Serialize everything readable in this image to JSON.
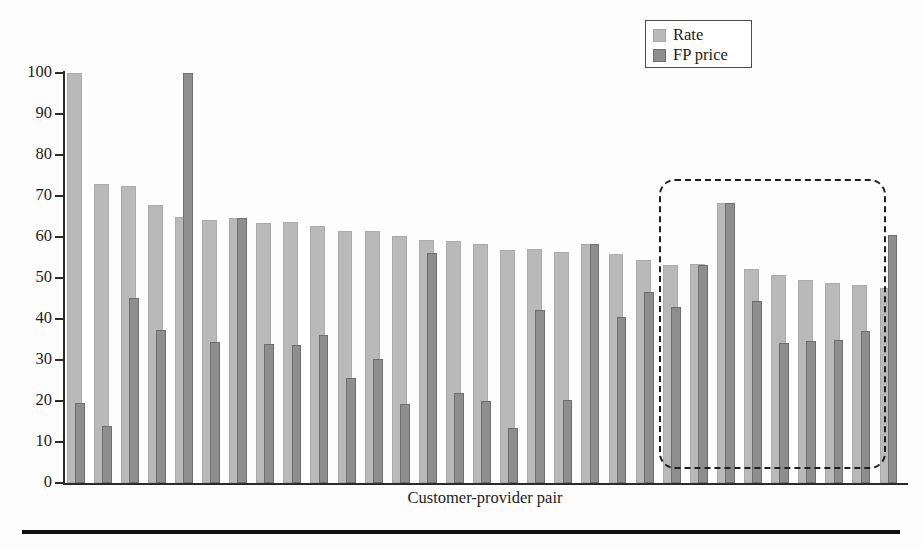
{
  "figure": {
    "background_color": "#fdfdfd",
    "bottom_rule_color": "#111111"
  },
  "legend": {
    "position": "top-right",
    "border_color": "#4a4a4a",
    "entries": [
      {
        "label": "Rate",
        "color": "#b9b9b9",
        "icon": "square-swatch-icon"
      },
      {
        "label": "FP price",
        "color": "#8e8e8e",
        "icon": "square-swatch-icon"
      }
    ]
  },
  "axes": {
    "xlabel": "Customer-provider pair",
    "ylabel": "",
    "yticks": [
      0,
      10,
      20,
      30,
      40,
      50,
      60,
      70,
      80,
      90,
      100
    ],
    "ytick_labels": [
      "0",
      "10",
      "20",
      "30",
      "40",
      "50",
      "60",
      "70",
      "80",
      "90",
      "100"
    ]
  },
  "annotations": [
    {
      "name": "highlight-box",
      "type": "dashed-rounded-rectangle",
      "style": "dashed",
      "color": "#1f1f1f",
      "covers_bars": "last 9 customer-provider pairs on the right"
    }
  ],
  "chart_data": {
    "type": "bar",
    "title": "",
    "xlabel": "Customer-provider pair",
    "ylabel": "",
    "ylim": [
      0,
      100
    ],
    "xlim": [
      0,
      31
    ],
    "grid": false,
    "legend_position": "upper right",
    "categories": [
      "1",
      "2",
      "3",
      "4",
      "5",
      "6",
      "7",
      "8",
      "9",
      "10",
      "11",
      "12",
      "13",
      "14",
      "15",
      "16",
      "17",
      "18",
      "19",
      "20",
      "21",
      "22",
      "23",
      "24",
      "25",
      "26",
      "27",
      "28",
      "29",
      "30",
      "31"
    ],
    "series": [
      {
        "name": "Rate",
        "color": "#b9b9b9",
        "values": [
          100,
          73,
          72.5,
          67.8,
          65,
          64.2,
          64.7,
          63.5,
          63.6,
          62.6,
          61.5,
          61.4,
          60.2,
          59.3,
          59.1,
          58.2,
          56.8,
          57,
          56.4,
          58.3,
          55.8,
          54.5,
          53.2,
          53.5,
          68.3,
          52.2,
          50.8,
          49.4,
          48.7,
          48.2,
          47.5
        ]
      },
      {
        "name": "FP price",
        "color": "#8e8e8e",
        "values": [
          19.6,
          13.9,
          45.2,
          37.2,
          100,
          34.5,
          64.7,
          33.8,
          33.6,
          36.2,
          25.5,
          30.2,
          19.2,
          56.1,
          22,
          20,
          13.5,
          42.3,
          20.2,
          58.3,
          40.4,
          46.6,
          43,
          53.2,
          68.3,
          44.4,
          34.2,
          34.6,
          34.8,
          37,
          60.4
        ]
      }
    ]
  }
}
